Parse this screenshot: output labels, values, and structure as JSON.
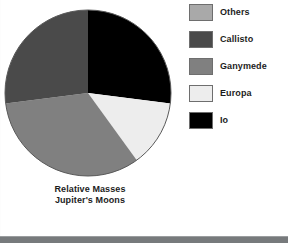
{
  "figure": {
    "caption_line1": "Relative Masses",
    "caption_line2": "Jupiter's Moons"
  },
  "legend": {
    "items": [
      {
        "label": "Others",
        "color": "#a9a9a9"
      },
      {
        "label": "Callisto",
        "color": "#4a4a4a"
      },
      {
        "label": "Ganymede",
        "color": "#808080"
      },
      {
        "label": "Europa",
        "color": "#ededed"
      },
      {
        "label": "Io",
        "color": "#000000"
      }
    ]
  },
  "chart_data": {
    "type": "pie",
    "title": "Relative Masses Jupiter's Moons",
    "xlabel": "",
    "ylabel": "",
    "categories": [
      "Io",
      "Europa",
      "Ganymede",
      "Callisto",
      "Others"
    ],
    "values": [
      27,
      13,
      33,
      27,
      0
    ],
    "units": "percent of total mass",
    "slice_angles_deg": [
      97,
      46,
      119,
      98,
      0
    ],
    "colors": [
      "#000000",
      "#ededed",
      "#808080",
      "#4a4a4a",
      "#a9a9a9"
    ],
    "start_angle_deg": 0,
    "direction": "clockwise",
    "legend_position": "right",
    "grid": false,
    "annotations": []
  }
}
